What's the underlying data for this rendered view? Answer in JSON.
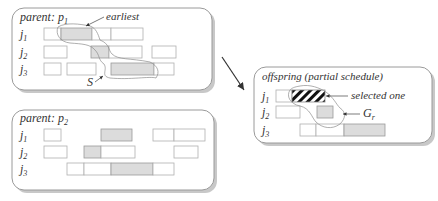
{
  "diagram": {
    "panels": [
      {
        "id": "parent-p1",
        "title_prefix": "parent: ",
        "title_var": "p",
        "title_sub": "1",
        "x": 12,
        "y": 8,
        "w": 200,
        "h": 82,
        "rows": [
          {
            "label": "j",
            "sub": "1",
            "y": 28,
            "boxes": [
              [
                44,
                61,
                ""
              ],
              [
                61,
                92,
                "gray"
              ],
              [
                92,
                111,
                ""
              ],
              [
                111,
                143,
                ""
              ]
            ]
          },
          {
            "label": "j",
            "sub": "2",
            "y": 46,
            "boxes": [
              [
                44,
                67,
                ""
              ],
              [
                91,
                109,
                "gray"
              ],
              [
                109,
                142,
                ""
              ],
              [
                152,
                176,
                ""
              ]
            ]
          },
          {
            "label": "j",
            "sub": "3",
            "y": 63,
            "boxes": [
              [
                44,
                61,
                ""
              ],
              [
                67,
                96,
                ""
              ],
              [
                111,
                154,
                "gray"
              ],
              [
                154,
                174,
                ""
              ]
            ]
          }
        ],
        "annotations": [
          {
            "text": "earliest",
            "x": 106,
            "y": 20
          },
          {
            "text": "S",
            "x": 89,
            "y": 84
          }
        ]
      },
      {
        "id": "parent-p2",
        "title_prefix": "parent: ",
        "title_var": "p",
        "title_sub": "2",
        "x": 12,
        "y": 110,
        "w": 202,
        "h": 80,
        "rows": [
          {
            "label": "j",
            "sub": "1",
            "y": 129,
            "boxes": [
              [
                44,
                61,
                ""
              ],
              [
                101,
                132,
                "gray"
              ],
              [
                153,
                174,
                ""
              ],
              [
                174,
                205,
                ""
              ]
            ]
          },
          {
            "label": "j",
            "sub": "2",
            "y": 146,
            "boxes": [
              [
                44,
                67,
                ""
              ],
              [
                84,
                101,
                "gray"
              ],
              [
                101,
                135,
                ""
              ],
              [
                174,
                198,
                ""
              ]
            ]
          },
          {
            "label": "j",
            "sub": "3",
            "y": 163,
            "boxes": [
              [
                67,
                84,
                ""
              ],
              [
                84,
                111,
                ""
              ],
              [
                111,
                153,
                "gray"
              ],
              [
                153,
                174,
                ""
              ]
            ]
          }
        ],
        "annotations": []
      },
      {
        "id": "offspring",
        "title_prefix": "offspring (partial schedule)",
        "title_var": "",
        "title_sub": "",
        "x": 254,
        "y": 67,
        "w": 178,
        "h": 76,
        "rows": [
          {
            "label": "j",
            "sub": "1",
            "y": 90,
            "boxes": [
              [
                276,
                292,
                ""
              ],
              [
                292,
                325,
                "hatched"
              ]
            ]
          },
          {
            "label": "j",
            "sub": "2",
            "y": 106,
            "boxes": [
              [
                276,
                300,
                ""
              ],
              [
                317,
                333,
                "gray"
              ]
            ]
          },
          {
            "label": "j",
            "sub": "3",
            "y": 124,
            "boxes": [
              [
                300,
                316,
                ""
              ],
              [
                316,
                344,
                ""
              ],
              [
                344,
                385,
                "gray"
              ]
            ]
          }
        ],
        "annotations": [
          {
            "text": "selected one",
            "x": 350,
            "y": 99
          },
          {
            "text": "G",
            "sub": "r",
            "x": 361,
            "y": 117
          }
        ]
      }
    ],
    "main_arrow": {
      "from": [
        222,
        57
      ],
      "to": [
        244,
        90
      ]
    }
  }
}
